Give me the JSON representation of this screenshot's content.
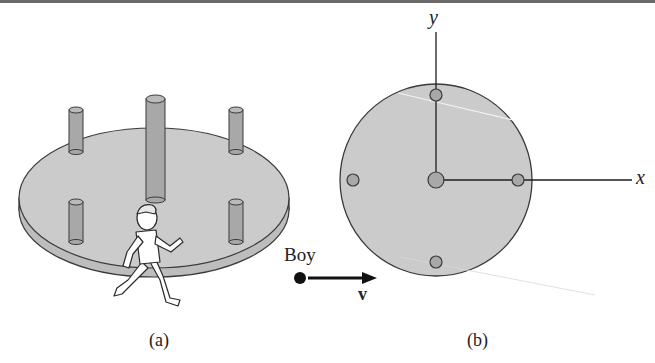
{
  "figure": {
    "panel_a": {
      "caption": "(a)",
      "description": "Merry-go-round platform with five vertical posts; a boy runs tangentially"
    },
    "panel_b": {
      "caption": "(b)",
      "description": "Top view of platform with coordinate axes"
    },
    "labels": {
      "boy": "Boy",
      "velocity": "v",
      "x_axis": "x",
      "y_axis": "y"
    },
    "colors": {
      "platform_fill": "#c9c9c9",
      "outline": "#3a3a3a",
      "post_fill": "#a9a9a9",
      "arrow": "#111111"
    }
  }
}
